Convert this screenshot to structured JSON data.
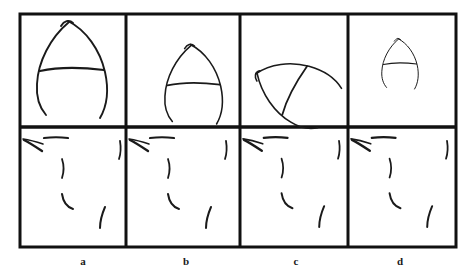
{
  "figure": {
    "type": "sketch-grid",
    "background_color": "#ffffff",
    "ink_color": "#1a1a1a",
    "grid": {
      "columns": 4,
      "rows": 2,
      "outer_border_color": "#111111",
      "outer_border_width_px": 3,
      "divider_color": "#111111",
      "divider_width_px": 3,
      "left_px": 20,
      "top_px": 14,
      "right_px": 456,
      "bottom_px": 247,
      "middle_divider_y_px": 127,
      "vertical_divider_x_px": [
        126,
        240,
        348
      ]
    },
    "columns": [
      {
        "label": "a",
        "label_x_px": 83,
        "top_panel": {
          "name": "crescent-arc-sketch-large-upright",
          "description": "hand-drawn crescent arc with crossing stroke, large, upright",
          "scale": 1.0,
          "rotation_deg": 0,
          "center_x_px": 70,
          "center_y_px": 68
        },
        "bottom_panel": {
          "name": "stroke-fragments-set",
          "description": "scattered short pen-stroke fragments",
          "fragment_count": 5
        }
      },
      {
        "label": "b",
        "label_x_px": 186,
        "top_panel": {
          "name": "crescent-arc-sketch-medium-upright",
          "description": "hand-drawn crescent arc with crossing stroke, medium, upright",
          "scale": 0.82,
          "rotation_deg": 0,
          "center_x_px": 192,
          "center_y_px": 83
        },
        "bottom_panel": {
          "name": "stroke-fragments-set",
          "description": "scattered short pen-stroke fragments",
          "fragment_count": 5
        }
      },
      {
        "label": "c",
        "label_x_px": 296,
        "top_panel": {
          "name": "crescent-arc-sketch-rotated",
          "description": "hand-drawn crescent arc with crossing stroke, rotated counter-clockwise",
          "scale": 0.85,
          "rotation_deg": -62,
          "center_x_px": 292,
          "center_y_px": 91
        },
        "bottom_panel": {
          "name": "stroke-fragments-set",
          "description": "scattered short pen-stroke fragments",
          "fragment_count": 5
        }
      },
      {
        "label": "d",
        "label_x_px": 400,
        "top_panel": {
          "name": "crescent-arc-sketch-small-upright",
          "description": "hand-drawn crescent arc with crossing stroke, small, upright",
          "scale": 0.52,
          "rotation_deg": 0,
          "center_x_px": 399,
          "center_y_px": 63
        },
        "bottom_panel": {
          "name": "stroke-fragments-set",
          "description": "scattered short pen-stroke fragments",
          "fragment_count": 5
        }
      }
    ]
  }
}
